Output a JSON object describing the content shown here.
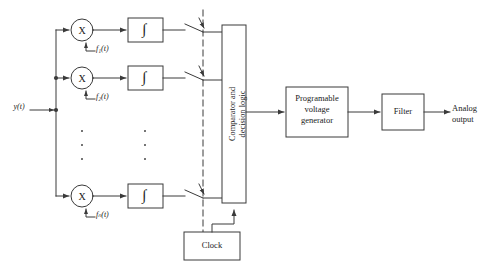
{
  "diagram": {
    "background_color": "#ffffff",
    "line_color": "#3a3a3a",
    "text_color": "#1a1a1a",
    "input": {
      "label": "y(t)"
    },
    "output": {
      "line1": "Analog",
      "line2": "output"
    },
    "branches": [
      {
        "multiplier_label": "X",
        "integrator_label": "∫",
        "reference_label": "f₁(t)",
        "reference_base": "f",
        "reference_sub": "1",
        "reference_arg": "(t)"
      },
      {
        "multiplier_label": "X",
        "integrator_label": "∫",
        "reference_label": "f₂(t)",
        "reference_base": "f",
        "reference_sub": "2",
        "reference_arg": "(t)"
      },
      {
        "multiplier_label": "X",
        "integrator_label": "∫",
        "reference_label": "fₙ(t)",
        "reference_base": "f",
        "reference_sub": "n",
        "reference_arg": "(t)"
      }
    ],
    "ellipsis_dots": 3,
    "comparator": {
      "line1": "Comparator and",
      "line2": "decision logic"
    },
    "generator": {
      "line1": "Programable",
      "line2": "voltage",
      "line3": "generator"
    },
    "filter": {
      "label": "Filter"
    },
    "clock": {
      "label": "Clock"
    },
    "switches": {
      "count": 3,
      "name": "sampling-switch"
    }
  }
}
